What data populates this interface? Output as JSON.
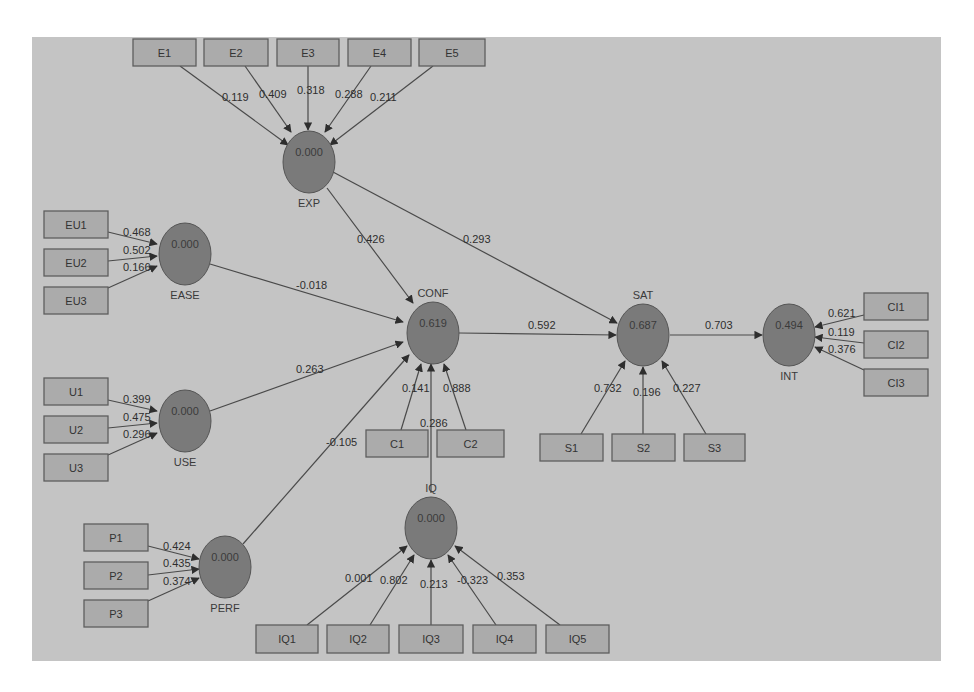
{
  "diagram": {
    "type": "PLS path model",
    "colors": {
      "canvas": "#c4c4c4",
      "latent_fill": "#7a7a7a",
      "indicator_fill": "#ababab",
      "line": "#4a4a4a"
    },
    "latents": [
      {
        "id": "EXP",
        "label": "EXP",
        "value": "0.000",
        "cx": 309,
        "cy": 162,
        "label_pos": "below"
      },
      {
        "id": "EASE",
        "label": "EASE",
        "value": "0.000",
        "cx": 185,
        "cy": 254,
        "label_pos": "below"
      },
      {
        "id": "CONF",
        "label": "CONF",
        "value": "0.619",
        "cx": 433,
        "cy": 333,
        "label_pos": "above"
      },
      {
        "id": "USE",
        "label": "USE",
        "value": "0.000",
        "cx": 185,
        "cy": 421,
        "label_pos": "below"
      },
      {
        "id": "PERF",
        "label": "PERF",
        "value": "0.000",
        "cx": 225,
        "cy": 567,
        "label_pos": "below"
      },
      {
        "id": "IQ",
        "label": "IQ",
        "value": "0.000",
        "cx": 431,
        "cy": 528,
        "label_pos": "above"
      },
      {
        "id": "SAT",
        "label": "SAT",
        "value": "0.687",
        "cx": 643,
        "cy": 335,
        "label_pos": "above"
      },
      {
        "id": "INT",
        "label": "INT",
        "value": "0.494",
        "cx": 789,
        "cy": 335,
        "label_pos": "below"
      }
    ],
    "indicators": [
      {
        "id": "E1",
        "label": "E1",
        "x": 133,
        "y": 39,
        "w": 63,
        "h": 27
      },
      {
        "id": "E2",
        "label": "E2",
        "x": 204,
        "y": 39,
        "w": 64,
        "h": 27
      },
      {
        "id": "E3",
        "label": "E3",
        "x": 277,
        "y": 39,
        "w": 62,
        "h": 27
      },
      {
        "id": "E4",
        "label": "E4",
        "x": 348,
        "y": 39,
        "w": 63,
        "h": 27
      },
      {
        "id": "E5",
        "label": "E5",
        "x": 419,
        "y": 39,
        "w": 66,
        "h": 27
      },
      {
        "id": "EU1",
        "label": "EU1",
        "x": 44,
        "y": 211,
        "w": 64,
        "h": 27
      },
      {
        "id": "EU2",
        "label": "EU2",
        "x": 44,
        "y": 249,
        "w": 64,
        "h": 27
      },
      {
        "id": "EU3",
        "label": "EU3",
        "x": 44,
        "y": 287,
        "w": 64,
        "h": 27
      },
      {
        "id": "U1",
        "label": "U1",
        "x": 44,
        "y": 378,
        "w": 64,
        "h": 27
      },
      {
        "id": "U2",
        "label": "U2",
        "x": 44,
        "y": 416,
        "w": 64,
        "h": 27
      },
      {
        "id": "U3",
        "label": "U3",
        "x": 44,
        "y": 454,
        "w": 64,
        "h": 27
      },
      {
        "id": "P1",
        "label": "P1",
        "x": 84,
        "y": 524,
        "w": 64,
        "h": 27
      },
      {
        "id": "P2",
        "label": "P2",
        "x": 84,
        "y": 562,
        "w": 64,
        "h": 27
      },
      {
        "id": "P3",
        "label": "P3",
        "x": 84,
        "y": 600,
        "w": 64,
        "h": 27
      },
      {
        "id": "C1",
        "label": "C1",
        "x": 366,
        "y": 430,
        "w": 62,
        "h": 27
      },
      {
        "id": "C2",
        "label": "C2",
        "x": 437,
        "y": 430,
        "w": 67,
        "h": 27
      },
      {
        "id": "S1",
        "label": "S1",
        "x": 540,
        "y": 434,
        "w": 63,
        "h": 27
      },
      {
        "id": "S2",
        "label": "S2",
        "x": 612,
        "y": 434,
        "w": 63,
        "h": 27
      },
      {
        "id": "S3",
        "label": "S3",
        "x": 684,
        "y": 434,
        "w": 61,
        "h": 27
      },
      {
        "id": "IQ1",
        "label": "IQ1",
        "x": 256,
        "y": 625,
        "w": 62,
        "h": 28
      },
      {
        "id": "IQ2",
        "label": "IQ2",
        "x": 327,
        "y": 625,
        "w": 62,
        "h": 28
      },
      {
        "id": "IQ3",
        "label": "IQ3",
        "x": 399,
        "y": 625,
        "w": 64,
        "h": 28
      },
      {
        "id": "IQ4",
        "label": "IQ4",
        "x": 473,
        "y": 625,
        "w": 63,
        "h": 28
      },
      {
        "id": "IQ5",
        "label": "IQ5",
        "x": 546,
        "y": 625,
        "w": 63,
        "h": 28
      },
      {
        "id": "CI1",
        "label": "CI1",
        "x": 864,
        "y": 293,
        "w": 64,
        "h": 27
      },
      {
        "id": "CI2",
        "label": "CI2",
        "x": 864,
        "y": 331,
        "w": 64,
        "h": 27
      },
      {
        "id": "CI3",
        "label": "CI3",
        "x": 864,
        "y": 369,
        "w": 64,
        "h": 27
      }
    ],
    "edges": [
      {
        "from": "E1",
        "to": "EXP",
        "weight": "0.119",
        "x1": 180,
        "y1": 66,
        "x2": 288,
        "y2": 145,
        "lx": 222,
        "ly": 101
      },
      {
        "from": "E2",
        "to": "EXP",
        "weight": "0.409",
        "x1": 245,
        "y1": 66,
        "x2": 291,
        "y2": 132,
        "lx": 259,
        "ly": 98
      },
      {
        "from": "E3",
        "to": "EXP",
        "weight": "0.318",
        "x1": 308,
        "y1": 66,
        "x2": 308,
        "y2": 130,
        "lx": 297,
        "ly": 94
      },
      {
        "from": "E4",
        "to": "EXP",
        "weight": "0.288",
        "x1": 371,
        "y1": 66,
        "x2": 325,
        "y2": 132,
        "lx": 335,
        "ly": 98
      },
      {
        "from": "E5",
        "to": "EXP",
        "weight": "0.211",
        "x1": 433,
        "y1": 66,
        "x2": 330,
        "y2": 145,
        "lx": 370,
        "ly": 101
      },
      {
        "from": "EU1",
        "to": "EASE",
        "weight": "0.468",
        "x1": 108,
        "y1": 232,
        "x2": 157,
        "y2": 244,
        "lx": 123,
        "ly": 236
      },
      {
        "from": "EU2",
        "to": "EASE",
        "weight": "0.502",
        "x1": 108,
        "y1": 261,
        "x2": 157,
        "y2": 256,
        "lx": 123,
        "ly": 254
      },
      {
        "from": "EU3",
        "to": "EASE",
        "weight": "0.166",
        "x1": 108,
        "y1": 288,
        "x2": 157,
        "y2": 266,
        "lx": 123,
        "ly": 271
      },
      {
        "from": "U1",
        "to": "USE",
        "weight": "0.399",
        "x1": 108,
        "y1": 400,
        "x2": 157,
        "y2": 411,
        "lx": 123,
        "ly": 403
      },
      {
        "from": "U2",
        "to": "USE",
        "weight": "0.475",
        "x1": 108,
        "y1": 428,
        "x2": 157,
        "y2": 423,
        "lx": 123,
        "ly": 421
      },
      {
        "from": "U3",
        "to": "USE",
        "weight": "0.296",
        "x1": 108,
        "y1": 455,
        "x2": 157,
        "y2": 433,
        "lx": 123,
        "ly": 438
      },
      {
        "from": "P1",
        "to": "PERF",
        "weight": "0.424",
        "x1": 148,
        "y1": 546,
        "x2": 199,
        "y2": 559,
        "lx": 163,
        "ly": 550
      },
      {
        "from": "P2",
        "to": "PERF",
        "weight": "0.435",
        "x1": 148,
        "y1": 575,
        "x2": 199,
        "y2": 569,
        "lx": 163,
        "ly": 567
      },
      {
        "from": "P3",
        "to": "PERF",
        "weight": "0.374",
        "x1": 148,
        "y1": 601,
        "x2": 199,
        "y2": 578,
        "lx": 163,
        "ly": 585
      },
      {
        "from": "EXP",
        "to": "CONF",
        "weight": "0.426",
        "x1": 327,
        "y1": 188,
        "x2": 413,
        "y2": 303,
        "lx": 357,
        "ly": 243
      },
      {
        "from": "EXP",
        "to": "SAT",
        "weight": "0.293",
        "x1": 333,
        "y1": 172,
        "x2": 617,
        "y2": 323,
        "lx": 463,
        "ly": 243
      },
      {
        "from": "EASE",
        "to": "CONF",
        "weight": "-0.018",
        "x1": 210,
        "y1": 264,
        "x2": 403,
        "y2": 322,
        "lx": 296,
        "ly": 289
      },
      {
        "from": "USE",
        "to": "CONF",
        "weight": "0.263",
        "x1": 210,
        "y1": 411,
        "x2": 403,
        "y2": 342,
        "lx": 296,
        "ly": 373
      },
      {
        "from": "PERF",
        "to": "CONF",
        "weight": "-0.105",
        "x1": 243,
        "y1": 544,
        "x2": 409,
        "y2": 355,
        "lx": 326,
        "ly": 446
      },
      {
        "from": "C1",
        "to": "CONF",
        "weight": "0.141",
        "x1": 401,
        "y1": 430,
        "x2": 421,
        "y2": 364,
        "lx": 402,
        "ly": 392
      },
      {
        "from": "C2",
        "to": "CONF",
        "weight": "0.888",
        "x1": 466,
        "y1": 430,
        "x2": 444,
        "y2": 364,
        "lx": 443,
        "ly": 392
      },
      {
        "from": "IQ",
        "to": "CONF",
        "weight": "0.286",
        "x1": 431,
        "y1": 493,
        "x2": 431,
        "y2": 364,
        "lx": 420,
        "ly": 427
      },
      {
        "from": "CONF",
        "to": "SAT",
        "weight": "0.592",
        "x1": 459,
        "y1": 333,
        "x2": 616,
        "y2": 335,
        "lx": 528,
        "ly": 329
      },
      {
        "from": "S1",
        "to": "SAT",
        "weight": "0.732",
        "x1": 581,
        "y1": 434,
        "x2": 625,
        "y2": 361,
        "lx": 594,
        "ly": 392
      },
      {
        "from": "S2",
        "to": "SAT",
        "weight": "0.196",
        "x1": 643,
        "y1": 434,
        "x2": 643,
        "y2": 367,
        "lx": 633,
        "ly": 396
      },
      {
        "from": "S3",
        "to": "SAT",
        "weight": "0.227",
        "x1": 706,
        "y1": 434,
        "x2": 662,
        "y2": 361,
        "lx": 673,
        "ly": 392
      },
      {
        "from": "SAT",
        "to": "INT",
        "weight": "0.703",
        "x1": 670,
        "y1": 335,
        "x2": 762,
        "y2": 335,
        "lx": 705,
        "ly": 329
      },
      {
        "from": "CI1",
        "to": "INT",
        "weight": "0.621",
        "x1": 864,
        "y1": 315,
        "x2": 815,
        "y2": 327,
        "lx": 828,
        "ly": 317
      },
      {
        "from": "CI2",
        "to": "INT",
        "weight": "0.119",
        "x1": 864,
        "y1": 343,
        "x2": 815,
        "y2": 337,
        "lx": 828,
        "ly": 336
      },
      {
        "from": "CI3",
        "to": "INT",
        "weight": "0.376",
        "x1": 864,
        "y1": 370,
        "x2": 815,
        "y2": 347,
        "lx": 828,
        "ly": 353
      },
      {
        "from": "IQ1",
        "to": "IQ",
        "weight": "0.001",
        "x1": 307,
        "y1": 625,
        "x2": 407,
        "y2": 546,
        "lx": 345,
        "ly": 582
      },
      {
        "from": "IQ2",
        "to": "IQ",
        "weight": "0.802",
        "x1": 370,
        "y1": 625,
        "x2": 414,
        "y2": 555,
        "lx": 380,
        "ly": 584
      },
      {
        "from": "IQ3",
        "to": "IQ",
        "weight": "0.213",
        "x1": 431,
        "y1": 625,
        "x2": 431,
        "y2": 560,
        "lx": 420,
        "ly": 588
      },
      {
        "from": "IQ4",
        "to": "IQ",
        "weight": "-0.323",
        "x1": 496,
        "y1": 625,
        "x2": 448,
        "y2": 555,
        "lx": 457,
        "ly": 584
      },
      {
        "from": "IQ5",
        "to": "IQ",
        "weight": "0.353",
        "x1": 560,
        "y1": 625,
        "x2": 455,
        "y2": 546,
        "lx": 497,
        "ly": 580
      }
    ]
  }
}
